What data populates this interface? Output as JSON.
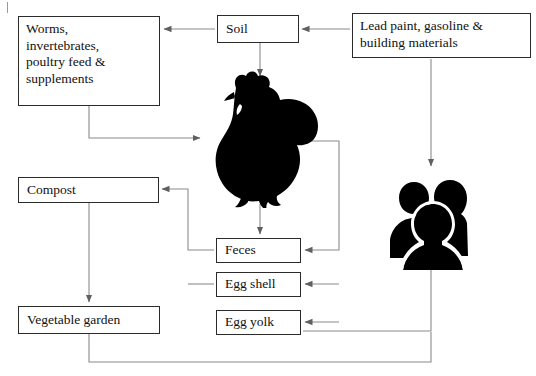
{
  "diagram": {
    "line_color": "#7d7d7d",
    "box_border_color": "#2b2b2b",
    "silhouette_color": "#000000",
    "background": "#ffffff"
  },
  "boxes": {
    "worms": {
      "label": "Worms,\ninvertebrates,\npoultry feed &\nsupplements"
    },
    "soil": {
      "label": "Soil"
    },
    "lead_source": {
      "label": "Lead paint, gasoline &\nbuilding materials"
    },
    "compost": {
      "label": "Compost"
    },
    "vegetable_garden": {
      "label": "Vegetable garden"
    },
    "feces": {
      "label": "Feces"
    },
    "egg_shell": {
      "label": "Egg shell"
    },
    "egg_yolk": {
      "label": "Egg yolk"
    }
  },
  "icons": {
    "chicken": {
      "name": "chicken-silhouette"
    },
    "people": {
      "name": "people-group-silhouette"
    }
  },
  "edges": [
    {
      "from": "lead_source",
      "to": "soil",
      "direction": "left"
    },
    {
      "from": "soil",
      "to": "worms",
      "direction": "left"
    },
    {
      "from": "soil",
      "to": "chicken",
      "direction": "down"
    },
    {
      "from": "worms",
      "to": "chicken",
      "direction": "right"
    },
    {
      "from": "lead_source",
      "to": "people",
      "direction": "down"
    },
    {
      "from": "chicken",
      "to": "feces",
      "direction": "down"
    },
    {
      "from": "chicken",
      "to": "feces",
      "direction": "left"
    },
    {
      "from": "chicken",
      "to": "egg_shell",
      "direction": "left"
    },
    {
      "from": "chicken",
      "to": "egg_yolk",
      "direction": "left"
    },
    {
      "from": "feces",
      "to": "compost",
      "direction": "left"
    },
    {
      "from": "egg_shell",
      "to": "compost",
      "direction": "left"
    },
    {
      "from": "compost",
      "to": "vegetable_garden",
      "direction": "down"
    },
    {
      "from": "egg_yolk",
      "to": "people",
      "direction": "up"
    },
    {
      "from": "vegetable_garden",
      "to": "people",
      "direction": "up"
    }
  ]
}
